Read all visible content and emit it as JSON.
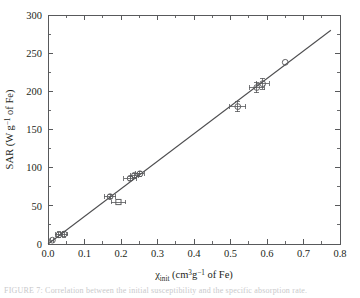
{
  "figure": {
    "background_color": "#ffffff",
    "axis_color": "#58595b",
    "line_color": "#4d4d4f",
    "marker_color": "#58595b",
    "clipped_caption": "FIGURE 7: Correlation between the initial susceptibility and the specific absorption rate."
  },
  "chart_data": {
    "type": "scatter",
    "title": "",
    "xlabel": "χinit (cm3 g−1 of Fe)",
    "ylabel": "SAR (W g−1 of Fe)",
    "xlabel_parts": {
      "symbol": "χ",
      "subscript": "init",
      "unit_pre": " (cm",
      "unit_sup1": "3",
      "unit_mid": "g",
      "unit_sup2": "−1",
      "unit_post": " of Fe)"
    },
    "ylabel_parts": {
      "prefix": "SAR (W g",
      "superscript": "−1",
      "suffix": " of Fe)"
    },
    "xlim": [
      0.0,
      0.8
    ],
    "ylim": [
      0,
      300
    ],
    "xticks": [
      0.0,
      0.1,
      0.2,
      0.3,
      0.4,
      0.5,
      0.6,
      0.7,
      0.8
    ],
    "xticklabels": [
      "0.0",
      "0.1",
      "0.2",
      "0.3",
      "0.4",
      "0.5",
      "0.6",
      "0.7",
      "0.8"
    ],
    "yticks": [
      0,
      50,
      100,
      150,
      200,
      250,
      300
    ],
    "yticklabels": [
      "0",
      "50",
      "100",
      "150",
      "200",
      "250",
      "300"
    ],
    "x_minor_interval": 0.05,
    "y_minor_interval": 25,
    "grid": false,
    "legend": null,
    "marker_style": "open-circle-and-open-square",
    "points": [
      {
        "x": 0.012,
        "y": 5,
        "xerr": 0.004,
        "yerr": 0,
        "marker": "circle"
      },
      {
        "x": 0.03,
        "y": 12,
        "xerr": 0.01,
        "yerr": 4,
        "marker": "circle"
      },
      {
        "x": 0.044,
        "y": 13,
        "xerr": 0.01,
        "yerr": 4,
        "marker": "circle"
      },
      {
        "x": 0.17,
        "y": 62,
        "xerr": 0.016,
        "yerr": 3,
        "marker": "circle"
      },
      {
        "x": 0.193,
        "y": 55,
        "xerr": 0.02,
        "yerr": 0,
        "marker": "square"
      },
      {
        "x": 0.225,
        "y": 86,
        "xerr": 0.018,
        "yerr": 3,
        "marker": "circle"
      },
      {
        "x": 0.237,
        "y": 90,
        "xerr": 0.012,
        "yerr": 3,
        "marker": "circle"
      },
      {
        "x": 0.252,
        "y": 92,
        "xerr": 0.012,
        "yerr": 3,
        "marker": "circle"
      },
      {
        "x": 0.52,
        "y": 180,
        "xerr": 0.022,
        "yerr": 7,
        "marker": "circle"
      },
      {
        "x": 0.572,
        "y": 205,
        "xerr": 0.02,
        "yerr": 7,
        "marker": "circle"
      },
      {
        "x": 0.588,
        "y": 210,
        "xerr": 0.018,
        "yerr": 7,
        "marker": "circle"
      },
      {
        "x": 0.65,
        "y": 238,
        "xerr": 0.0,
        "yerr": 0,
        "marker": "circle"
      }
    ],
    "fit_line": {
      "x_start": 0.0,
      "y_start": 0.0,
      "x_end": 0.775,
      "y_end": 280.0,
      "slope": 361.3,
      "intercept": 0.0
    }
  }
}
